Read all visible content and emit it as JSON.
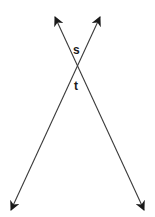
{
  "diagram": {
    "type": "intersecting-lines",
    "colors": {
      "background": "#ffffff",
      "line": "#3a3a3a",
      "arrowhead": "#1a1a1a",
      "label": "#1a1a1a"
    },
    "lines": [
      {
        "id": "line-1",
        "from": [
          55,
          17
        ],
        "to": [
          144,
          210
        ],
        "arrows": "both"
      },
      {
        "id": "line-2",
        "from": [
          100,
          17
        ],
        "to": [
          11,
          210
        ],
        "arrows": "both"
      }
    ],
    "intersection": [
      77.5,
      65.8
    ],
    "angle_labels": [
      {
        "text": "s",
        "position": "above-intersection",
        "x": 77,
        "y": 54
      },
      {
        "text": "t",
        "position": "below-intersection",
        "x": 77,
        "y": 89
      }
    ]
  }
}
